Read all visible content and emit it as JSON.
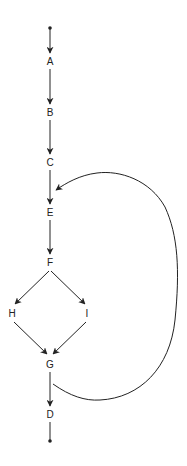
{
  "diagram": {
    "type": "control-flow-graph",
    "colors": {
      "stroke": "#222222",
      "background": "#ffffff"
    },
    "nodes": [
      {
        "id": "A",
        "label": "A"
      },
      {
        "id": "B",
        "label": "B"
      },
      {
        "id": "C",
        "label": "C"
      },
      {
        "id": "E",
        "label": "E"
      },
      {
        "id": "F",
        "label": "F"
      },
      {
        "id": "H",
        "label": "H"
      },
      {
        "id": "I",
        "label": "I"
      },
      {
        "id": "G",
        "label": "G"
      },
      {
        "id": "D",
        "label": "D"
      }
    ],
    "edges": [
      {
        "from": "start",
        "to": "A"
      },
      {
        "from": "A",
        "to": "B"
      },
      {
        "from": "B",
        "to": "C"
      },
      {
        "from": "C",
        "to": "E"
      },
      {
        "from": "E",
        "to": "F"
      },
      {
        "from": "F",
        "to": "H"
      },
      {
        "from": "F",
        "to": "I"
      },
      {
        "from": "H",
        "to": "G"
      },
      {
        "from": "I",
        "to": "G"
      },
      {
        "from": "G",
        "to": "D"
      },
      {
        "from": "G",
        "to": "E",
        "kind": "back-edge-loop"
      },
      {
        "from": "D",
        "to": "end"
      }
    ]
  }
}
